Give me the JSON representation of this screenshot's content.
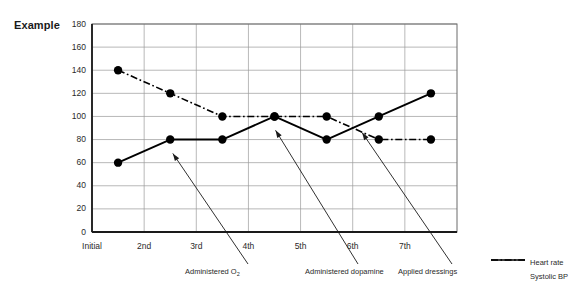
{
  "chart_data": {
    "type": "line",
    "title": "Example",
    "xlabel": "",
    "ylabel": "",
    "categories": [
      "Initial",
      "2nd",
      "3rd",
      "4th",
      "5th",
      "6th",
      "7th"
    ],
    "x_positions": [
      0.5,
      1.5,
      2.5,
      3.5,
      4.5,
      5.5,
      6.5
    ],
    "ylim": [
      0,
      180
    ],
    "ytick_values": [
      0,
      20,
      40,
      60,
      80,
      100,
      120,
      140,
      160,
      180
    ],
    "ytick_labels": [
      "0",
      "20",
      "40",
      "60",
      "80",
      "100",
      "120",
      "140",
      "160",
      "180"
    ],
    "grid": "both",
    "legend_position": "bottom-right",
    "series": [
      {
        "name": "Heart rate",
        "style": "dash-dot",
        "marker": "filled-circle",
        "color": "#000000",
        "values": [
          140,
          120,
          100,
          100,
          100,
          80,
          80
        ]
      },
      {
        "name": "Systolic BP",
        "style": "solid",
        "marker": "filled-circle",
        "color": "#000000",
        "values": [
          60,
          80,
          80,
          100,
          80,
          100,
          120
        ]
      }
    ],
    "annotations": [
      {
        "text": "Administered O",
        "sub": "2",
        "target_x": 1.5,
        "target_y": 68
      },
      {
        "text": "Administered dopamine",
        "sub": "",
        "target_x": 3.5,
        "target_y": 88
      },
      {
        "text": "Applied dressings",
        "sub": "",
        "target_x": 5.2,
        "target_y": 86
      }
    ]
  },
  "legend": {
    "items": [
      {
        "label": "Heart rate",
        "style": "dash-dot"
      },
      {
        "label": "Systolic BP",
        "style": "solid"
      }
    ]
  }
}
